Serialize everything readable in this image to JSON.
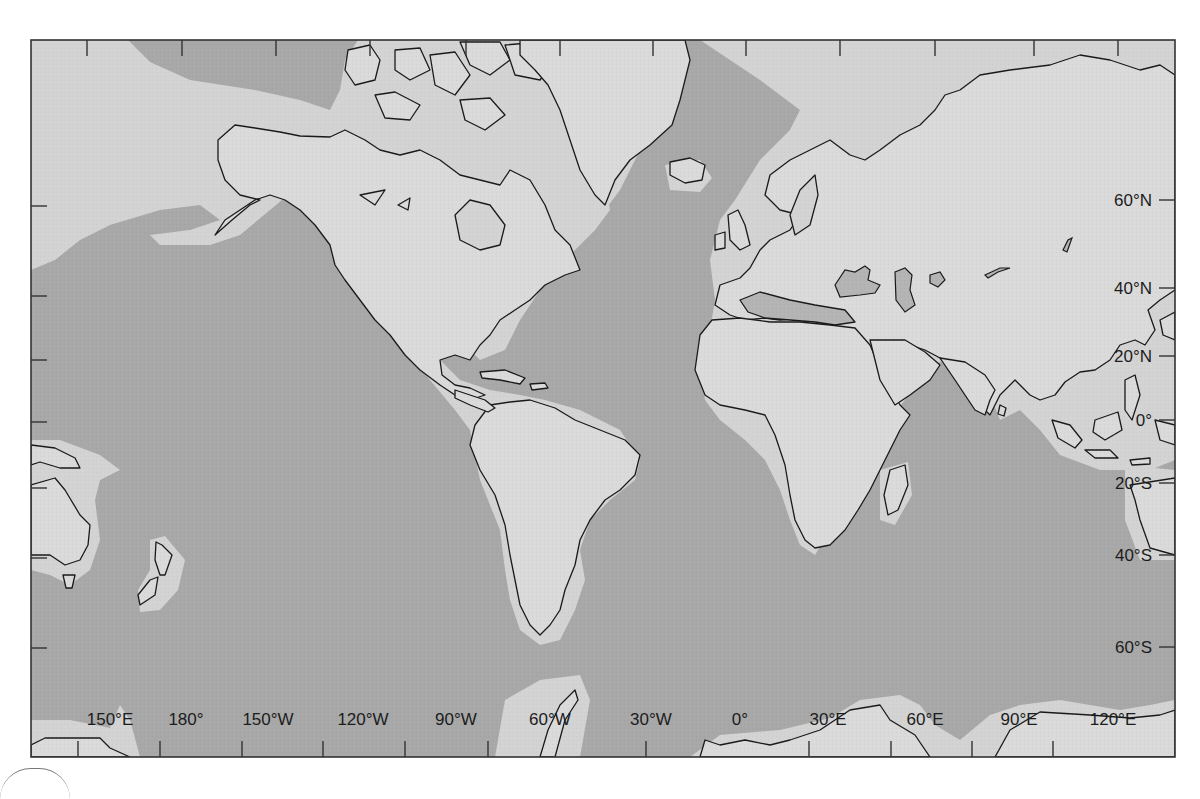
{
  "map": {
    "projection": "Mercator world map, Pacific-centered (starts ~135°E on left)",
    "legend_semantics": {
      "deep_ocean": "dark gray",
      "continental_shelf": "light gray band around coasts",
      "land": "light gray with black coastline outline",
      "inland_seas": "medium gray (Black Sea, Caspian Sea, Aral Sea, Lake Balkhash)"
    },
    "colors": {
      "ocean": "#a8a8a8",
      "shelf": "#d3d3d3",
      "land": "#dadada",
      "inland": "#b4b4b4",
      "frame": "#333333"
    },
    "longitude_labels": [
      {
        "label": "150°E",
        "x": 110
      },
      {
        "label": "180°",
        "x": 186
      },
      {
        "label": "150°W",
        "x": 268
      },
      {
        "label": "120°W",
        "x": 363
      },
      {
        "label": "90°W",
        "x": 456
      },
      {
        "label": "60°W",
        "x": 550
      },
      {
        "label": "30°W",
        "x": 651
      },
      {
        "label": "0°",
        "x": 740
      },
      {
        "label": "30°E",
        "x": 828
      },
      {
        "label": "60°E",
        "x": 925
      },
      {
        "label": "90°E",
        "x": 1019
      },
      {
        "label": "120°E",
        "x": 1113
      }
    ],
    "latitude_labels": [
      {
        "label": "60°N",
        "y": 200
      },
      {
        "label": "40°N",
        "y": 288
      },
      {
        "label": "20°N",
        "y": 356
      },
      {
        "label": "0°",
        "y": 420
      },
      {
        "label": "20°S",
        "y": 483
      },
      {
        "label": "40°S",
        "y": 555
      },
      {
        "label": "60°S",
        "y": 647
      }
    ]
  }
}
